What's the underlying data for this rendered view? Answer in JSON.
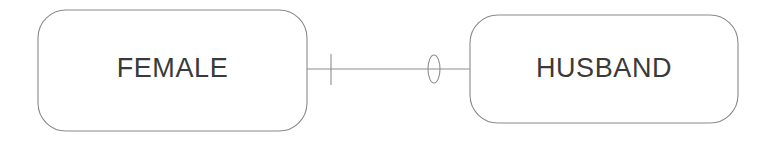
{
  "diagram": {
    "type": "entity-relationship-diagram",
    "notation": "crows-foot",
    "background_color": "#ffffff",
    "stroke_color": "#8d8d8d",
    "text_color": "#3a3a3a",
    "entities": [
      {
        "id": "female",
        "label": "FEMALE",
        "x": 38,
        "y": 10,
        "width": 269,
        "height": 121,
        "corner_radius": 28
      },
      {
        "id": "husband",
        "label": "HUSBAND",
        "x": 470,
        "y": 15,
        "width": 268,
        "height": 108,
        "corner_radius": 28
      }
    ],
    "relationship": {
      "id": "female-husband-link",
      "from": "female",
      "to": "husband",
      "line_y": 69,
      "line_start_x": 307,
      "line_end_x": 470,
      "source_cardinality": {
        "symbol": "one-mandatory-tick",
        "meaning": "exactly one",
        "x": 331,
        "y_top": 54,
        "y_bottom": 85
      },
      "target_cardinality": {
        "symbol": "zero-optional-ellipse",
        "meaning": "zero or one (optional)",
        "center_x": 434,
        "center_y": 69,
        "radius_x": 6,
        "radius_y": 14
      }
    }
  }
}
